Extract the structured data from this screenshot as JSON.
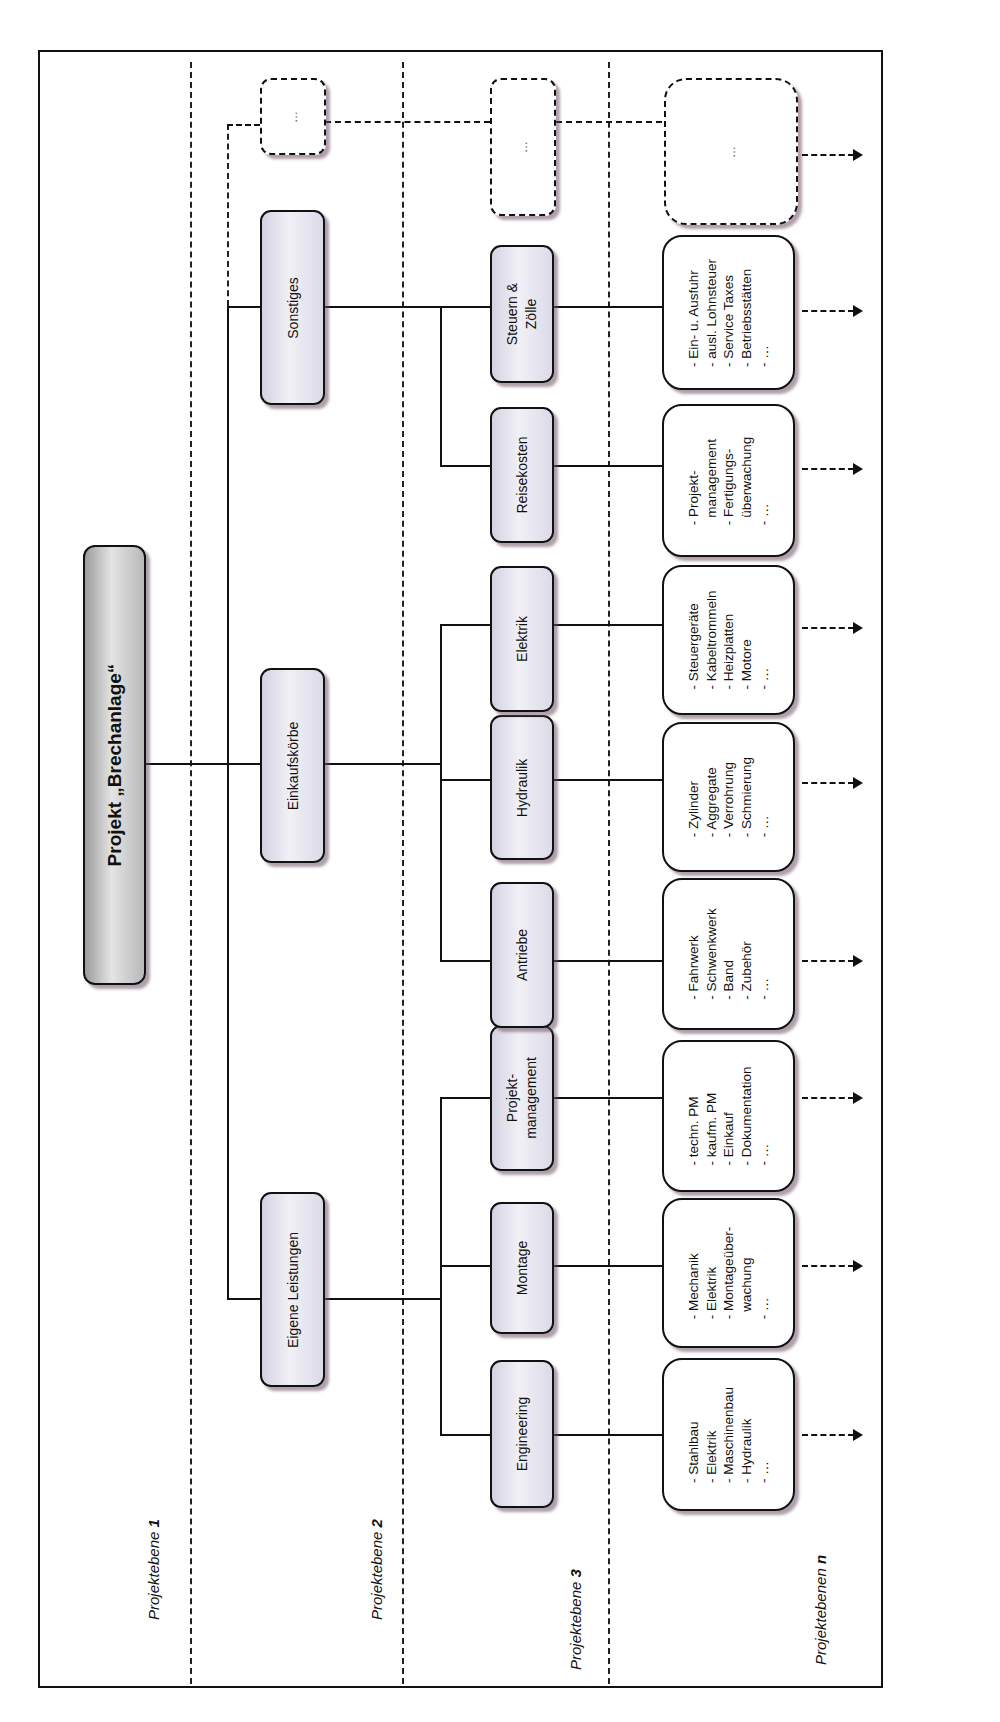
{
  "root": {
    "label": "Projekt „Brechanlage“"
  },
  "levels": [
    {
      "label": "Projektebene",
      "num": "1"
    },
    {
      "label": "Projektebene",
      "num": "2"
    },
    {
      "label": "Projektebene",
      "num": "3"
    },
    {
      "label": "Projektebenen",
      "num": "n"
    }
  ],
  "level1": [
    {
      "label": "Eigene Leistungen"
    },
    {
      "label": "Einkaufskörbe"
    },
    {
      "label": "Sonstiges"
    },
    {
      "label": "…"
    }
  ],
  "level2": [
    {
      "label": "Engineering"
    },
    {
      "label": "Montage"
    },
    {
      "label": "Projekt-",
      "label2": "management"
    },
    {
      "label": "Antriebe"
    },
    {
      "label": "Hydraulik"
    },
    {
      "label": "Elektrik"
    },
    {
      "label": "Reisekosten"
    },
    {
      "label": "Steuern &",
      "label2": "Zölle"
    },
    {
      "label": "…"
    }
  ],
  "level3": [
    {
      "items": [
        "- Stahlbau",
        "- Elektrik",
        "- Maschinenbau",
        "- Hydraulik",
        "- …"
      ]
    },
    {
      "items": [
        "- Mechanik",
        "- Elektrik",
        "- Montageüber-",
        "  wachung",
        "- …"
      ]
    },
    {
      "items": [
        "- techn. PM",
        "- kaufm. PM",
        "- Einkauf",
        "- Dokumentation",
        "- …"
      ]
    },
    {
      "items": [
        "- Fahrwerk",
        "- Schwenkwerk",
        "- Band",
        "- Zubehör",
        "- …"
      ]
    },
    {
      "items": [
        "- Zylinder",
        "- Aggregate",
        "- Verrohrung",
        "- Schmierung",
        "- …"
      ]
    },
    {
      "items": [
        "- Steuergeräte",
        "- Kabeltrommeln",
        "- Heizplatten",
        "- Motore",
        "- …"
      ]
    },
    {
      "items": [
        "- Projekt-",
        "  management",
        "- Fertigungs-",
        "  überwachung",
        "- …"
      ]
    },
    {
      "items": [
        "- Ein- u. Ausfuhr",
        "- ausl. Lohnsteuer",
        "- Service Taxes",
        "- Betriebsstätten",
        "- …"
      ]
    },
    {
      "items": [
        "…"
      ]
    }
  ],
  "colors": {
    "node_fill": "#e6e4ef",
    "root_fill": "#c8c8c8",
    "line": "#111111",
    "shadow": "#8a6a80"
  }
}
